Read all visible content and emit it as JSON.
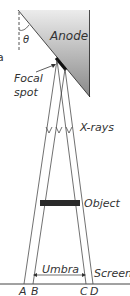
{
  "labels": {
    "fragment": "a",
    "theta": "θ",
    "anode": "Anode",
    "focal": "Focal",
    "spot": "spot",
    "xrays": "X-rays",
    "object": "Object",
    "umbra": "Umbra",
    "screen": "Screen",
    "A": "A",
    "B": "B",
    "C": "C",
    "D": "D"
  },
  "colors": {
    "anode_top": "#e8e8e8",
    "anode_bottom": "#8a8a8a",
    "lines": "#333333",
    "object": "#2a2a2a"
  }
}
